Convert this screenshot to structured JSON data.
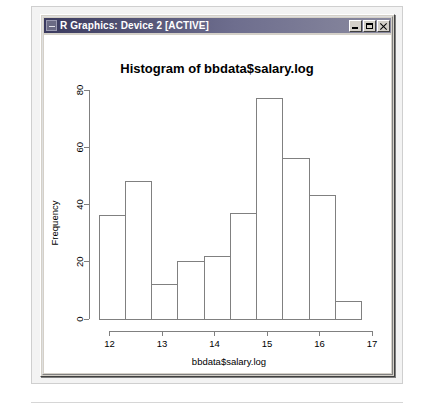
{
  "window": {
    "title": "R Graphics: Device 2 [ACTIVE]",
    "icon": "r-graphics-icon",
    "buttons": {
      "minimize": "minimize-button",
      "maximize": "maximize-button",
      "close": "close-button"
    }
  },
  "chart_data": {
    "type": "bar",
    "title": "Histogram of bbdata$salary.log",
    "xlabel": "bbdata$salary.log",
    "ylabel": "Frequency",
    "grid": false,
    "legend": null,
    "xlim": [
      11.8,
      17.0
    ],
    "ylim": [
      0,
      80
    ],
    "xticks": [
      12,
      13,
      14,
      15,
      16,
      17
    ],
    "yticks": [
      0,
      20,
      40,
      60,
      80
    ],
    "bin_width": 0.5,
    "bin_edges": [
      11.8,
      12.3,
      12.8,
      13.3,
      13.8,
      14.3,
      14.8,
      15.3,
      15.8,
      16.3,
      16.8
    ],
    "categories": [
      "11.8-12.3",
      "12.3-12.8",
      "12.8-13.3",
      "13.3-13.8",
      "13.8-14.3",
      "14.3-14.8",
      "14.8-15.3",
      "15.3-15.8",
      "15.8-16.3",
      "16.3-16.8"
    ],
    "values": [
      36,
      48,
      12,
      20,
      22,
      37,
      77,
      56,
      43,
      6
    ],
    "bar_fill": "#ffffff",
    "bar_stroke": "#808080",
    "axis_color": "#808080"
  }
}
